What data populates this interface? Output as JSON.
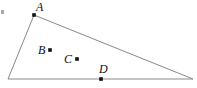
{
  "figure": {
    "width": 197,
    "height": 88,
    "background_color": "#ffffff",
    "line_color": "#8a8a8a",
    "point_color": "#111111",
    "label_color": "#111111"
  },
  "triangle": {
    "vertices": [
      {
        "name": "A",
        "x": 34,
        "y": 15
      },
      {
        "name": "bottom-left",
        "x": 8,
        "y": 79
      },
      {
        "name": "right",
        "x": 193,
        "y": 79
      }
    ],
    "path": "M 34 15 L 8 79 L 193 79 Z"
  },
  "points": [
    {
      "id": "A",
      "label": "A",
      "x": 34,
      "y": 15,
      "label_x": 36,
      "label_y": 1,
      "on": "vertex"
    },
    {
      "id": "B",
      "label": "B",
      "x": 50,
      "y": 50,
      "label_x": 38,
      "label_y": 44,
      "on": "interior"
    },
    {
      "id": "C",
      "label": "C",
      "x": 77,
      "y": 59,
      "label_x": 64,
      "label_y": 53,
      "on": "interior"
    },
    {
      "id": "D",
      "label": "D",
      "x": 101,
      "y": 79,
      "label_x": 99,
      "label_y": 63,
      "on": "bottom-edge"
    }
  ],
  "artifacts": {
    "corner_mark": "smudge"
  }
}
